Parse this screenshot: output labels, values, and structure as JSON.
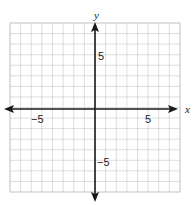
{
  "chart_data": {
    "type": "scatter",
    "title": "",
    "xlabel": "x",
    "ylabel": "y",
    "xlim": [
      -8,
      8
    ],
    "ylim": [
      -8,
      8
    ],
    "grid": true,
    "grid_step": 1,
    "x_tick_labels": [
      {
        "value": -5,
        "label": "−5"
      },
      {
        "value": 5,
        "label": "5"
      }
    ],
    "y_tick_labels": [
      {
        "value": 5,
        "label": "5"
      },
      {
        "value": -5,
        "label": "−5"
      }
    ],
    "series": [],
    "points": []
  },
  "axes": {
    "x_name": "x",
    "y_name": "y",
    "x_neg5": "−5",
    "x_pos5": "5",
    "y_pos5": "5",
    "y_neg5": "−5"
  },
  "colors": {
    "grid": "#c8c8c8",
    "axis": "#1a1a1a",
    "background": "#ffffff"
  }
}
